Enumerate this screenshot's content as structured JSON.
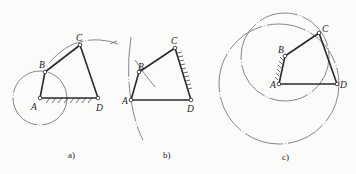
{
  "figure": {
    "panels": [
      {
        "id": "a",
        "caption": "a)",
        "points": {
          "A": "A",
          "B": "B",
          "C": "C",
          "D": "D"
        },
        "fixed_link": "AD",
        "description": "Four-bar linkage with frame AD fixed; circle traced by B about A; arc traced by C"
      },
      {
        "id": "b",
        "caption": "b)",
        "points": {
          "A": "A",
          "B": "B",
          "C": "C",
          "D": "D"
        },
        "fixed_link": "CD",
        "description": "Four-bar linkage with link CD fixed; arcs traced about B"
      },
      {
        "id": "c",
        "caption": "c)",
        "points": {
          "A": "A",
          "B": "B",
          "C": "C",
          "D": "D"
        },
        "fixed_link": "AB",
        "description": "Four-bar linkage with link AB fixed; circle about B through C and circle about A through D"
      }
    ]
  }
}
